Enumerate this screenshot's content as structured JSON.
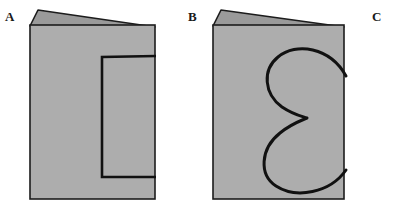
{
  "figure": {
    "background_color": "#ffffff",
    "width": 401,
    "height": 213
  },
  "palette": {
    "panel_fill": "#adadad",
    "flap_fill": "#9a9a9a",
    "outline": "#1c1c1c",
    "cut_line": "#111111",
    "label_color": "#1a1a1a",
    "background": "#ffffff"
  },
  "labels": {
    "a": "A",
    "b": "B",
    "c": "C"
  },
  "panels": [
    {
      "id": "a",
      "label": "A",
      "description": "Folded card with rectangular cut outline on front panel",
      "cut_shape": "rectangle",
      "cut_open_edge": "fold-right",
      "front_panel": {
        "x": 30,
        "y": 25,
        "width": 125,
        "height": 174
      },
      "flap": {
        "apex_x": 38,
        "apex_y": 10,
        "right_x": 155,
        "right_y": 27
      }
    },
    {
      "id": "b",
      "label": "B",
      "description": "Folded card with half-heart cut outline on front panel",
      "cut_shape": "half-heart",
      "cut_open_edge": "fold-right",
      "cusp": {
        "x": 307,
        "y": 118
      },
      "front_panel": {
        "x": 213,
        "y": 25,
        "width": 131,
        "height": 174
      },
      "flap": {
        "apex_x": 221,
        "apex_y": 10,
        "right_x": 344,
        "right_y": 27
      }
    },
    {
      "id": "c",
      "label": "C",
      "description": "Label only, no figure drawn",
      "cut_shape": "none",
      "has_figure": false
    }
  ]
}
